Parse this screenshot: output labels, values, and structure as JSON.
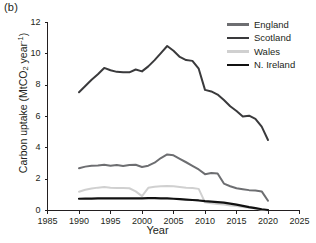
{
  "panel": {
    "label": "(b)"
  },
  "chart_data": {
    "type": "line",
    "title": "",
    "subtitle": "",
    "xlabel": "Year",
    "ylabel": "Carbon uptake (MtCO2 year-1)",
    "ylabel_parts": {
      "prefix": "Carbon uptake (MtCO",
      "sub": "2",
      "mid": " year",
      "sup": "-1",
      "suffix": ")"
    },
    "xlim": [
      1985,
      2025
    ],
    "ylim": [
      0,
      12
    ],
    "xticks": [
      1985,
      1990,
      1995,
      2000,
      2005,
      2010,
      2015,
      2020,
      2025
    ],
    "yticks": [
      0,
      2,
      4,
      6,
      8,
      10,
      12
    ],
    "grid": false,
    "legend_position": "top-right",
    "x": [
      1990,
      1991,
      1992,
      1993,
      1994,
      1995,
      1996,
      1997,
      1998,
      1999,
      2000,
      2001,
      2002,
      2003,
      2004,
      2005,
      2006,
      2007,
      2008,
      2009,
      2010,
      2011,
      2012,
      2013,
      2014,
      2015,
      2016,
      2017,
      2018,
      2019,
      2020
    ],
    "series": [
      {
        "name": "England",
        "color": "#6d6e71",
        "values": [
          2.7,
          2.8,
          2.86,
          2.88,
          2.92,
          2.86,
          2.9,
          2.84,
          2.9,
          2.92,
          2.78,
          2.86,
          3.05,
          3.35,
          3.58,
          3.52,
          3.3,
          3.08,
          2.85,
          2.62,
          2.32,
          2.4,
          2.36,
          1.72,
          1.55,
          1.42,
          1.36,
          1.3,
          1.28,
          1.22,
          0.62
        ]
      },
      {
        "name": "Scotland",
        "color": "#3a3a3c",
        "values": [
          7.55,
          7.95,
          8.35,
          8.7,
          9.1,
          8.95,
          8.85,
          8.82,
          8.82,
          9.0,
          8.88,
          9.2,
          9.6,
          10.05,
          10.5,
          10.2,
          9.8,
          9.6,
          9.55,
          9.05,
          7.7,
          7.6,
          7.4,
          7.05,
          6.65,
          6.35,
          6.0,
          6.05,
          5.85,
          5.35,
          4.5
        ]
      },
      {
        "name": "Wales",
        "color": "#d0d0d0",
        "values": [
          1.2,
          1.32,
          1.4,
          1.46,
          1.5,
          1.46,
          1.44,
          1.44,
          1.42,
          1.22,
          0.92,
          1.45,
          1.52,
          1.55,
          1.56,
          1.54,
          1.5,
          1.46,
          1.44,
          1.38,
          0.52,
          0.46,
          0.42,
          0.38,
          0.32,
          0.28,
          0.22,
          0.18,
          0.12,
          0.05,
          0.02
        ]
      },
      {
        "name": "N. Ireland",
        "color": "#111111",
        "values": [
          0.75,
          0.76,
          0.76,
          0.77,
          0.77,
          0.77,
          0.77,
          0.78,
          0.78,
          0.78,
          0.78,
          0.79,
          0.79,
          0.78,
          0.77,
          0.75,
          0.73,
          0.7,
          0.67,
          0.64,
          0.6,
          0.57,
          0.54,
          0.5,
          0.44,
          0.37,
          0.3,
          0.22,
          0.15,
          0.08,
          0.03
        ]
      }
    ]
  }
}
